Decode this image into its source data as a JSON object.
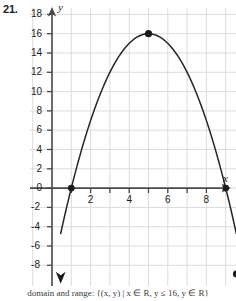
{
  "problem": {
    "number": "21."
  },
  "axes": {
    "x_letter": "x",
    "y_letter": "y",
    "x_tick_labels": [
      "2",
      "4",
      "6",
      "8"
    ],
    "y_tick_labels": [
      "18",
      "16",
      "14",
      "12",
      "10",
      "8",
      "6",
      "4",
      "2",
      "0",
      "-2",
      "-4",
      "-6",
      "-8"
    ]
  },
  "caption": {
    "text": "domain and range: {(x, y) | x ∈ R, y ≤ 16, y ∈ R}"
  },
  "colors": {
    "grid": "#dcdcdc",
    "axis": "#4a4a4a",
    "curve": "#262626",
    "text": "#1b1b1b",
    "background": "#ffffff"
  },
  "chart_data": {
    "type": "line",
    "title": "",
    "xlabel": "x",
    "ylabel": "y",
    "grid": true,
    "legend": "none",
    "xlim": [
      -0.7,
      9.9
    ],
    "ylim": [
      -9.7,
      19.4
    ],
    "x_ticks": [
      2,
      4,
      6,
      8
    ],
    "y_ticks": [
      18,
      16,
      14,
      12,
      10,
      8,
      6,
      4,
      2,
      0,
      -2,
      -4,
      -6,
      -8
    ],
    "curve": {
      "name": "parabola",
      "equation": "y = -(x - 1)(x - 9)",
      "expanded": "y = -x^2 + 10x - 9",
      "opens": "down",
      "vertex": [
        5,
        16
      ],
      "x_intercepts": [
        1,
        9
      ],
      "y_intercept": -9,
      "x": [
        0.45,
        1,
        2,
        3,
        4,
        5,
        6,
        7,
        8,
        9,
        9.55
      ],
      "values": [
        -8.9,
        0,
        7,
        12,
        15,
        16,
        15,
        12,
        7,
        0,
        -8.9
      ]
    },
    "points": [
      {
        "label": "x-intercept-left",
        "x": 1,
        "y": 0,
        "style": "filled-dot"
      },
      {
        "label": "vertex",
        "x": 5,
        "y": 16,
        "style": "filled-dot"
      },
      {
        "label": "x-intercept-right",
        "x": 9,
        "y": 0,
        "style": "filled-dot"
      },
      {
        "label": "right-endpoint",
        "x": 9.55,
        "y": -8.9,
        "style": "filled-dot"
      }
    ],
    "arrows": [
      {
        "label": "left-end-arrow",
        "x": 0.45,
        "y": -9.3,
        "direction": "down"
      },
      {
        "label": "x-axis-arrow",
        "direction": "right"
      },
      {
        "label": "y-axis-arrow",
        "direction": "up"
      }
    ]
  }
}
